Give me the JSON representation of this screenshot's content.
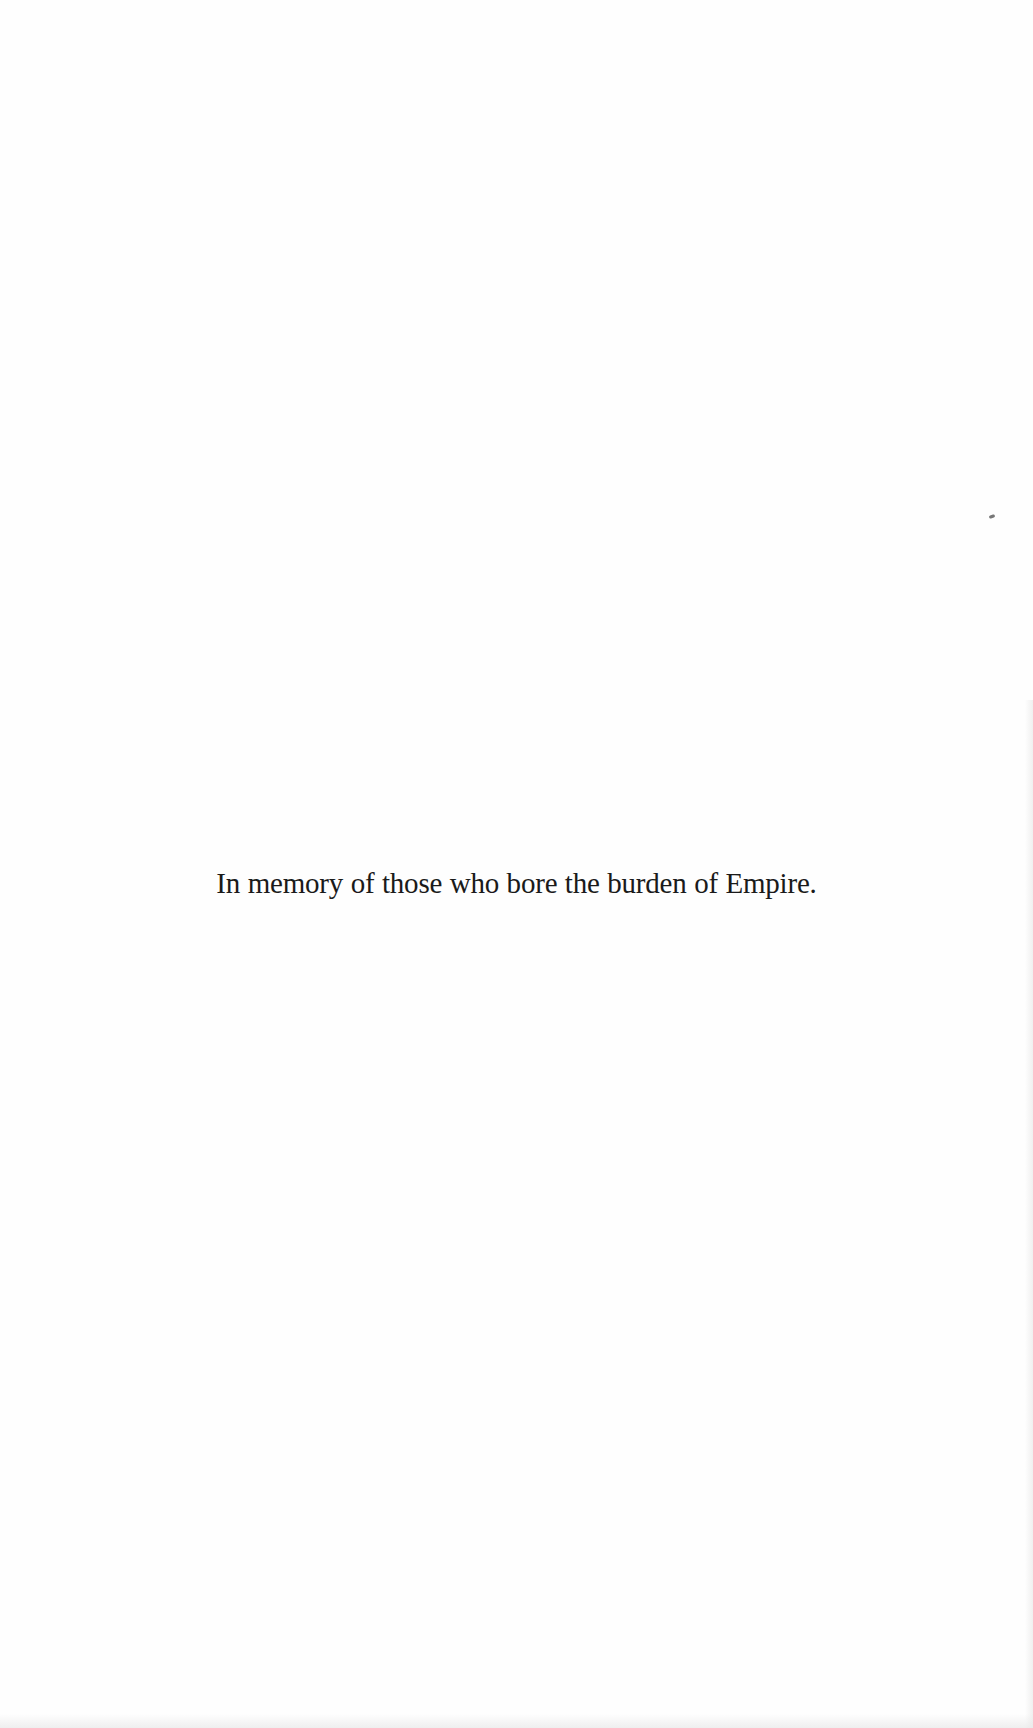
{
  "page": {
    "type": "dedication",
    "dedication_text": "In memory of those who bore the burden of Empire."
  },
  "colors": {
    "background": "#fefefe",
    "text": "#1a1a1a"
  }
}
